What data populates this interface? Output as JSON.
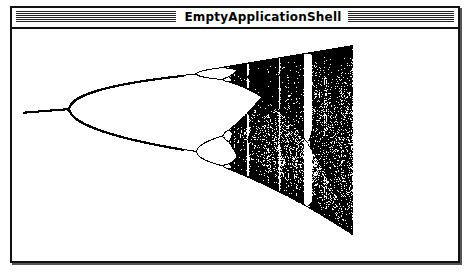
{
  "window": {
    "title": "EmptyApplicationShell"
  },
  "chart_data": {
    "type": "scatter",
    "title": "",
    "xlabel": "",
    "ylabel": "",
    "x_range": [
      2.84,
      4.0
    ],
    "y_range": [
      0,
      1
    ],
    "grid": false,
    "legend": "none",
    "features": {
      "first_bifurcation_r": 3.0,
      "second_bifurcation_r": 3.449,
      "period_three_window_r": 3.83,
      "chaos_end_r": 4.0
    },
    "color": "#000000"
  }
}
